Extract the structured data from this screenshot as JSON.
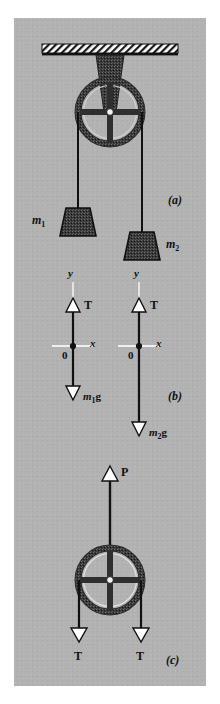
{
  "figure": {
    "background_color": "#b2b2b2",
    "ink_color": "#1a1a1a",
    "panels": [
      {
        "id": "a",
        "label": "(a)",
        "caption": "pulley with two hanging masses"
      },
      {
        "id": "b",
        "label": "(b)",
        "caption": "free-body diagrams of the masses"
      },
      {
        "id": "c",
        "label": "(c)",
        "caption": "free-body diagram of the pulley"
      }
    ],
    "panel_a": {
      "label": "(a)",
      "ceiling": "hatched-ceiling",
      "bracket": "pulley-mount-bracket",
      "pulley": "pulley-wheel",
      "mass_left": {
        "label": "m",
        "sub": "1"
      },
      "mass_right": {
        "label": "m",
        "sub": "2"
      }
    },
    "panel_b": {
      "label": "(b)",
      "bodies": [
        {
          "name": "mass-1-free-body",
          "axis_y": "y",
          "axis_x": "x",
          "origin": "0",
          "force_up": "T",
          "force_down_prefix": "m",
          "force_down_sub": "1",
          "force_down_suffix": "g"
        },
        {
          "name": "mass-2-free-body",
          "axis_y": "y",
          "axis_x": "x",
          "origin": "0",
          "force_up": "T",
          "force_down_prefix": "m",
          "force_down_sub": "2",
          "force_down_suffix": "g"
        }
      ]
    },
    "panel_c": {
      "label": "(c)",
      "force_up": "P",
      "force_down_left": "T",
      "force_down_right": "T",
      "pulley": "pulley-wheel"
    }
  }
}
